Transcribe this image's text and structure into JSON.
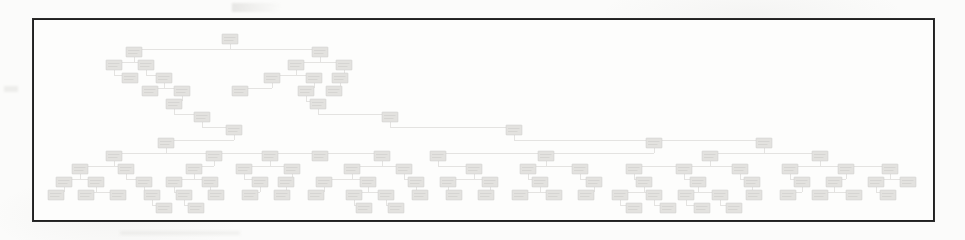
{
  "page": {
    "background_color": "#fbfbfa",
    "kind": "scanned-document-figure",
    "legible_text": "none - all node labels are illegible at this scan resolution"
  },
  "figure": {
    "frame": {
      "border_color": "#2b2b2b",
      "border_width_px": 2,
      "fill_color": "#fdfdfc",
      "x": 32,
      "y": 18,
      "width": 903,
      "height": 204
    },
    "caption": "",
    "title": ""
  },
  "artifacts": [
    {
      "name": "top-smudge",
      "x": 232,
      "y": 3,
      "width": 52,
      "height": 9
    },
    {
      "name": "left-smudge",
      "x": 4,
      "y": 86,
      "width": 14,
      "height": 6
    },
    {
      "name": "bottom-smudge",
      "x": 120,
      "y": 231,
      "width": 120,
      "height": 4
    }
  ],
  "chart_data": {
    "type": "diagram",
    "diagram_type": "tree",
    "title": "",
    "xlabel": "",
    "ylabel": "",
    "node_count": 203,
    "node_style": {
      "fill": "#d6d5d1",
      "stroke": "#a9a8a3",
      "width": 16,
      "height": 10,
      "label_text": "illegible"
    },
    "edge_style": {
      "stroke": "#b9b8b3",
      "routing": "orthogonal"
    },
    "levels": [
      {
        "index": 0,
        "y": 14,
        "node_count": 1
      },
      {
        "index": 1,
        "y": 27,
        "node_count": 3
      },
      {
        "index": 2,
        "y": 40,
        "node_count": 7
      },
      {
        "index": 3,
        "y": 53,
        "node_count": 9
      },
      {
        "index": 4,
        "y": 66,
        "node_count": 8
      },
      {
        "index": 5,
        "y": 79,
        "node_count": 6
      },
      {
        "index": 6,
        "y": 92,
        "node_count": 5
      },
      {
        "index": 7,
        "y": 105,
        "node_count": 7
      },
      {
        "index": 8,
        "y": 118,
        "node_count": 12
      },
      {
        "index": 9,
        "y": 131,
        "node_count": 17
      },
      {
        "index": 10,
        "y": 144,
        "node_count": 28
      },
      {
        "index": 11,
        "y": 157,
        "node_count": 49
      },
      {
        "index": 12,
        "y": 170,
        "node_count": 42
      },
      {
        "index": 13,
        "y": 183,
        "node_count": 19
      }
    ],
    "nodes": [
      {
        "id": "n0",
        "x": 196,
        "y": 14,
        "level": 0,
        "label": ""
      },
      {
        "id": "n1",
        "x": 100,
        "y": 27,
        "level": 1,
        "label": ""
      },
      {
        "id": "n2",
        "x": 286,
        "y": 27,
        "level": 1,
        "label": ""
      },
      {
        "id": "n3",
        "x": 80,
        "y": 40,
        "level": 2,
        "label": ""
      },
      {
        "id": "n4",
        "x": 112,
        "y": 40,
        "level": 2,
        "label": ""
      },
      {
        "id": "n5",
        "x": 262,
        "y": 40,
        "level": 2,
        "label": ""
      },
      {
        "id": "n6",
        "x": 310,
        "y": 40,
        "level": 2,
        "label": ""
      },
      {
        "id": "n7",
        "x": 96,
        "y": 53,
        "level": 3,
        "label": ""
      },
      {
        "id": "n8",
        "x": 130,
        "y": 53,
        "level": 3,
        "label": ""
      },
      {
        "id": "n9",
        "x": 238,
        "y": 53,
        "level": 3,
        "label": ""
      },
      {
        "id": "n10",
        "x": 280,
        "y": 53,
        "level": 3,
        "label": ""
      },
      {
        "id": "n11",
        "x": 306,
        "y": 53,
        "level": 3,
        "label": ""
      },
      {
        "id": "n12",
        "x": 116,
        "y": 66,
        "level": 4,
        "label": ""
      },
      {
        "id": "n13",
        "x": 148,
        "y": 66,
        "level": 4,
        "label": ""
      },
      {
        "id": "n14",
        "x": 206,
        "y": 66,
        "level": 4,
        "label": ""
      },
      {
        "id": "n15",
        "x": 272,
        "y": 66,
        "level": 4,
        "label": ""
      },
      {
        "id": "n16",
        "x": 300,
        "y": 66,
        "level": 4,
        "label": ""
      },
      {
        "id": "n17",
        "x": 140,
        "y": 79,
        "level": 5,
        "label": ""
      },
      {
        "id": "n18",
        "x": 284,
        "y": 79,
        "level": 5,
        "label": ""
      },
      {
        "id": "n19",
        "x": 168,
        "y": 92,
        "level": 6,
        "label": ""
      },
      {
        "id": "n20",
        "x": 356,
        "y": 92,
        "level": 6,
        "label": ""
      },
      {
        "id": "n21",
        "x": 200,
        "y": 105,
        "level": 7,
        "label": ""
      },
      {
        "id": "n22",
        "x": 480,
        "y": 105,
        "level": 7,
        "label": ""
      },
      {
        "id": "n23",
        "x": 132,
        "y": 118,
        "level": 8,
        "label": ""
      },
      {
        "id": "n24",
        "x": 620,
        "y": 118,
        "level": 8,
        "label": ""
      },
      {
        "id": "n25",
        "x": 730,
        "y": 118,
        "level": 8,
        "label": ""
      },
      {
        "id": "n26",
        "x": 80,
        "y": 131,
        "level": 9,
        "label": ""
      },
      {
        "id": "n27",
        "x": 180,
        "y": 131,
        "level": 9,
        "label": ""
      },
      {
        "id": "n28",
        "x": 236,
        "y": 131,
        "level": 9,
        "label": ""
      },
      {
        "id": "n29",
        "x": 286,
        "y": 131,
        "level": 9,
        "label": ""
      },
      {
        "id": "n30",
        "x": 348,
        "y": 131,
        "level": 9,
        "label": ""
      },
      {
        "id": "n31",
        "x": 404,
        "y": 131,
        "level": 9,
        "label": ""
      },
      {
        "id": "n32",
        "x": 512,
        "y": 131,
        "level": 9,
        "label": ""
      },
      {
        "id": "n33",
        "x": 676,
        "y": 131,
        "level": 9,
        "label": ""
      },
      {
        "id": "n34",
        "x": 786,
        "y": 131,
        "level": 9,
        "label": ""
      },
      {
        "id": "n35",
        "x": 46,
        "y": 144,
        "level": 10,
        "label": ""
      },
      {
        "id": "n36",
        "x": 92,
        "y": 144,
        "level": 10,
        "label": ""
      },
      {
        "id": "n37",
        "x": 160,
        "y": 144,
        "level": 10,
        "label": ""
      },
      {
        "id": "n38",
        "x": 210,
        "y": 144,
        "level": 10,
        "label": ""
      },
      {
        "id": "n39",
        "x": 258,
        "y": 144,
        "level": 10,
        "label": ""
      },
      {
        "id": "n40",
        "x": 318,
        "y": 144,
        "level": 10,
        "label": ""
      },
      {
        "id": "n41",
        "x": 370,
        "y": 144,
        "level": 10,
        "label": ""
      },
      {
        "id": "n42",
        "x": 440,
        "y": 144,
        "level": 10,
        "label": ""
      },
      {
        "id": "n43",
        "x": 494,
        "y": 144,
        "level": 10,
        "label": ""
      },
      {
        "id": "n44",
        "x": 546,
        "y": 144,
        "level": 10,
        "label": ""
      },
      {
        "id": "n45",
        "x": 600,
        "y": 144,
        "level": 10,
        "label": ""
      },
      {
        "id": "n46",
        "x": 650,
        "y": 144,
        "level": 10,
        "label": ""
      },
      {
        "id": "n47",
        "x": 706,
        "y": 144,
        "level": 10,
        "label": ""
      },
      {
        "id": "n48",
        "x": 756,
        "y": 144,
        "level": 10,
        "label": ""
      },
      {
        "id": "n49",
        "x": 812,
        "y": 144,
        "level": 10,
        "label": ""
      },
      {
        "id": "n50",
        "x": 856,
        "y": 144,
        "level": 10,
        "label": ""
      },
      {
        "id": "n51",
        "x": 30,
        "y": 157,
        "level": 11,
        "label": ""
      },
      {
        "id": "n52",
        "x": 62,
        "y": 157,
        "level": 11,
        "label": ""
      },
      {
        "id": "n53",
        "x": 110,
        "y": 157,
        "level": 11,
        "label": ""
      },
      {
        "id": "n54",
        "x": 140,
        "y": 157,
        "level": 11,
        "label": ""
      },
      {
        "id": "n55",
        "x": 176,
        "y": 157,
        "level": 11,
        "label": ""
      },
      {
        "id": "n56",
        "x": 226,
        "y": 157,
        "level": 11,
        "label": ""
      },
      {
        "id": "n57",
        "x": 252,
        "y": 157,
        "level": 11,
        "label": ""
      },
      {
        "id": "n58",
        "x": 290,
        "y": 157,
        "level": 11,
        "label": ""
      },
      {
        "id": "n59",
        "x": 334,
        "y": 157,
        "level": 11,
        "label": ""
      },
      {
        "id": "n60",
        "x": 382,
        "y": 157,
        "level": 11,
        "label": ""
      },
      {
        "id": "n61",
        "x": 414,
        "y": 157,
        "level": 11,
        "label": ""
      },
      {
        "id": "n62",
        "x": 456,
        "y": 157,
        "level": 11,
        "label": ""
      },
      {
        "id": "n63",
        "x": 506,
        "y": 157,
        "level": 11,
        "label": ""
      },
      {
        "id": "n64",
        "x": 560,
        "y": 157,
        "level": 11,
        "label": ""
      },
      {
        "id": "n65",
        "x": 610,
        "y": 157,
        "level": 11,
        "label": ""
      },
      {
        "id": "n66",
        "x": 664,
        "y": 157,
        "level": 11,
        "label": ""
      },
      {
        "id": "n67",
        "x": 718,
        "y": 157,
        "level": 11,
        "label": ""
      },
      {
        "id": "n68",
        "x": 768,
        "y": 157,
        "level": 11,
        "label": ""
      },
      {
        "id": "n69",
        "x": 800,
        "y": 157,
        "level": 11,
        "label": ""
      },
      {
        "id": "n70",
        "x": 842,
        "y": 157,
        "level": 11,
        "label": ""
      },
      {
        "id": "n71",
        "x": 874,
        "y": 157,
        "level": 11,
        "label": ""
      },
      {
        "id": "n72",
        "x": 22,
        "y": 170,
        "level": 12,
        "label": ""
      },
      {
        "id": "n73",
        "x": 52,
        "y": 170,
        "level": 12,
        "label": ""
      },
      {
        "id": "n74",
        "x": 84,
        "y": 170,
        "level": 12,
        "label": ""
      },
      {
        "id": "n75",
        "x": 118,
        "y": 170,
        "level": 12,
        "label": ""
      },
      {
        "id": "n76",
        "x": 150,
        "y": 170,
        "level": 12,
        "label": ""
      },
      {
        "id": "n77",
        "x": 182,
        "y": 170,
        "level": 12,
        "label": ""
      },
      {
        "id": "n78",
        "x": 216,
        "y": 170,
        "level": 12,
        "label": ""
      },
      {
        "id": "n79",
        "x": 248,
        "y": 170,
        "level": 12,
        "label": ""
      },
      {
        "id": "n80",
        "x": 282,
        "y": 170,
        "level": 12,
        "label": ""
      },
      {
        "id": "n81",
        "x": 320,
        "y": 170,
        "level": 12,
        "label": ""
      },
      {
        "id": "n82",
        "x": 352,
        "y": 170,
        "level": 12,
        "label": ""
      },
      {
        "id": "n83",
        "x": 386,
        "y": 170,
        "level": 12,
        "label": ""
      },
      {
        "id": "n84",
        "x": 420,
        "y": 170,
        "level": 12,
        "label": ""
      },
      {
        "id": "n85",
        "x": 452,
        "y": 170,
        "level": 12,
        "label": ""
      },
      {
        "id": "n86",
        "x": 486,
        "y": 170,
        "level": 12,
        "label": ""
      },
      {
        "id": "n87",
        "x": 520,
        "y": 170,
        "level": 12,
        "label": ""
      },
      {
        "id": "n88",
        "x": 552,
        "y": 170,
        "level": 12,
        "label": ""
      },
      {
        "id": "n89",
        "x": 586,
        "y": 170,
        "level": 12,
        "label": ""
      },
      {
        "id": "n90",
        "x": 620,
        "y": 170,
        "level": 12,
        "label": ""
      },
      {
        "id": "n91",
        "x": 652,
        "y": 170,
        "level": 12,
        "label": ""
      },
      {
        "id": "n92",
        "x": 686,
        "y": 170,
        "level": 12,
        "label": ""
      },
      {
        "id": "n93",
        "x": 720,
        "y": 170,
        "level": 12,
        "label": ""
      },
      {
        "id": "n94",
        "x": 754,
        "y": 170,
        "level": 12,
        "label": ""
      },
      {
        "id": "n95",
        "x": 786,
        "y": 170,
        "level": 12,
        "label": ""
      },
      {
        "id": "n96",
        "x": 820,
        "y": 170,
        "level": 12,
        "label": ""
      },
      {
        "id": "n97",
        "x": 854,
        "y": 170,
        "level": 12,
        "label": ""
      },
      {
        "id": "n98",
        "x": 130,
        "y": 183,
        "level": 13,
        "label": ""
      },
      {
        "id": "n99",
        "x": 162,
        "y": 183,
        "level": 13,
        "label": ""
      },
      {
        "id": "n100",
        "x": 330,
        "y": 183,
        "level": 13,
        "label": ""
      },
      {
        "id": "n101",
        "x": 362,
        "y": 183,
        "level": 13,
        "label": ""
      },
      {
        "id": "n102",
        "x": 600,
        "y": 183,
        "level": 13,
        "label": ""
      },
      {
        "id": "n103",
        "x": 634,
        "y": 183,
        "level": 13,
        "label": ""
      },
      {
        "id": "n104",
        "x": 668,
        "y": 183,
        "level": 13,
        "label": ""
      },
      {
        "id": "n105",
        "x": 700,
        "y": 183,
        "level": 13,
        "label": ""
      }
    ]
  }
}
